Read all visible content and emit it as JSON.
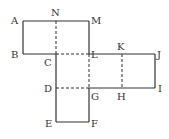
{
  "diagram": {
    "type": "cube-net",
    "line_color": "#333333",
    "labels": {
      "A": "A",
      "B": "B",
      "C": "C",
      "D": "D",
      "E": "E",
      "F": "F",
      "G": "G",
      "H": "H",
      "I": "I",
      "J": "J",
      "K": "K",
      "L": "L",
      "M": "M",
      "N": "N"
    },
    "points": {
      "A": [
        23,
        21
      ],
      "N": [
        56,
        21
      ],
      "M": [
        89,
        21
      ],
      "B": [
        23,
        54
      ],
      "C": [
        56,
        54
      ],
      "L": [
        89,
        54
      ],
      "K": [
        122,
        54
      ],
      "J": [
        155,
        54
      ],
      "D": [
        56,
        88
      ],
      "G": [
        89,
        88
      ],
      "H": [
        122,
        88
      ],
      "I": [
        155,
        88
      ],
      "E": [
        56,
        122
      ],
      "F": [
        89,
        122
      ]
    },
    "solid_edges": [
      [
        "A",
        "M"
      ],
      [
        "A",
        "B"
      ],
      [
        "B",
        "C"
      ],
      [
        "M",
        "L"
      ],
      [
        "L",
        "J"
      ],
      [
        "J",
        "I"
      ],
      [
        "G",
        "I"
      ],
      [
        "C",
        "E"
      ],
      [
        "E",
        "F"
      ],
      [
        "G",
        "F"
      ]
    ],
    "dashed_edges": [
      [
        "N",
        "C"
      ],
      [
        "C",
        "L"
      ],
      [
        "L",
        "G"
      ],
      [
        "D",
        "G"
      ],
      [
        "K",
        "H"
      ]
    ]
  }
}
